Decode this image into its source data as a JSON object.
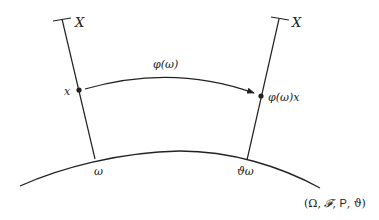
{
  "diagram": {
    "type": "random dynamical system / cocycle over fibers",
    "fibers": [
      {
        "label": "X",
        "point_label": "x",
        "base_label": "ω"
      },
      {
        "label": "X",
        "point_label": "φ(ω)x",
        "base_label": "ϑω"
      }
    ],
    "arrow": {
      "label": "φ(ω)"
    },
    "base_space": {
      "label_parts": [
        "(Ω, ",
        "𝓕",
        ", ",
        "P",
        ", ϑ)"
      ],
      "label": "(Ω, 𝓕, P, ϑ)"
    }
  },
  "colors": {
    "stroke": "#222222",
    "background": "#ffffff"
  }
}
